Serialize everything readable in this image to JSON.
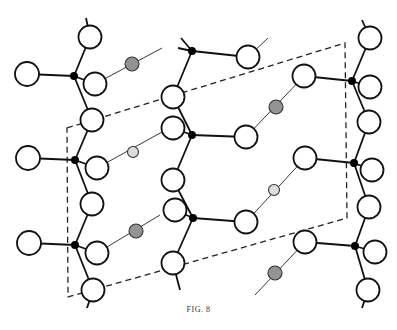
{
  "figure": {
    "caption": "FIG. 8",
    "colors": {
      "line": "#111111",
      "atom_fill": "#ffffff",
      "junction_fill": "#000000",
      "hatched_fill": "#9a9a9a",
      "light_fill": "#dcdcdc",
      "cell_outline": "#222222"
    },
    "unit_cell": [
      [
        67,
        128
      ],
      [
        345,
        43
      ],
      [
        347,
        218
      ],
      [
        68,
        297
      ]
    ],
    "junctions": [
      [
        74,
        76
      ],
      [
        75,
        160
      ],
      [
        75,
        245
      ],
      [
        192,
        51
      ],
      [
        192,
        135
      ],
      [
        193,
        218
      ],
      [
        352,
        81
      ],
      [
        354,
        163
      ],
      [
        355,
        246
      ]
    ],
    "atoms_large": [
      [
        90,
        37
      ],
      [
        27,
        74
      ],
      [
        95,
        84
      ],
      [
        92,
        120
      ],
      [
        28,
        158
      ],
      [
        97,
        168
      ],
      [
        92,
        204
      ],
      [
        29,
        243
      ],
      [
        97,
        253
      ],
      [
        93,
        290
      ],
      [
        248,
        57
      ],
      [
        173,
        97
      ],
      [
        173,
        128
      ],
      [
        246,
        137
      ],
      [
        173,
        180
      ],
      [
        175,
        210
      ],
      [
        246,
        222
      ],
      [
        173,
        263
      ],
      [
        304,
        76
      ],
      [
        370,
        38
      ],
      [
        370,
        87
      ],
      [
        369,
        122
      ],
      [
        305,
        158
      ],
      [
        372,
        170
      ],
      [
        369,
        207
      ],
      [
        305,
        242
      ],
      [
        375,
        252
      ],
      [
        368,
        290
      ]
    ],
    "atoms_hatched": [
      [
        132,
        64
      ],
      [
        136,
        231
      ],
      [
        276,
        107
      ],
      [
        275,
        273
      ]
    ],
    "atoms_light": [
      [
        133,
        152
      ],
      [
        274,
        190
      ]
    ]
  }
}
